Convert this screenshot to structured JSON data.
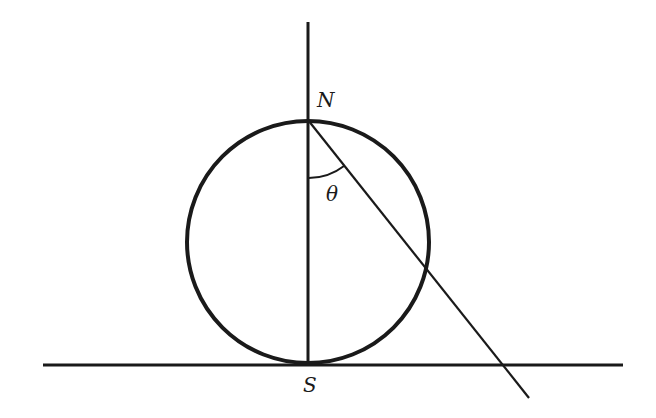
{
  "diagram": {
    "labels": {
      "north": "N",
      "south": "S",
      "angle": "θ"
    },
    "colors": {
      "stroke": "#1a1a1a",
      "background": "#ffffff"
    },
    "geometry": {
      "circle": {
        "cx": 308,
        "cy": 242,
        "r": 121
      },
      "vertical_line": {
        "x": 308,
        "y1": 22,
        "y2": 364
      },
      "horizontal_line": {
        "y": 365,
        "x1": 43,
        "x2": 623
      },
      "ray_from_N": {
        "x1": 308,
        "y1": 120,
        "x2": 529,
        "y2": 398
      }
    }
  }
}
